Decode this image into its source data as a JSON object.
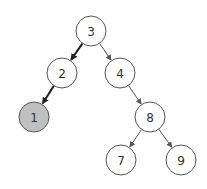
{
  "diagram": {
    "type": "binary-tree",
    "nodes": [
      {
        "id": "n3",
        "label": "3",
        "x": 91,
        "y": 31,
        "highlighted": false
      },
      {
        "id": "n2",
        "label": "2",
        "x": 62,
        "y": 73,
        "highlighted": false
      },
      {
        "id": "n4",
        "label": "4",
        "x": 120,
        "y": 73,
        "highlighted": false
      },
      {
        "id": "n1",
        "label": "1",
        "x": 34,
        "y": 117,
        "highlighted": true
      },
      {
        "id": "n8",
        "label": "8",
        "x": 150,
        "y": 117,
        "highlighted": false
      },
      {
        "id": "n7",
        "label": "7",
        "x": 121,
        "y": 160,
        "highlighted": false
      },
      {
        "id": "n9",
        "label": "9",
        "x": 181,
        "y": 160,
        "highlighted": false
      }
    ],
    "edges": [
      {
        "from": "n3",
        "to": "n2",
        "bold": true
      },
      {
        "from": "n3",
        "to": "n4",
        "bold": false
      },
      {
        "from": "n2",
        "to": "n1",
        "bold": true
      },
      {
        "from": "n4",
        "to": "n8",
        "bold": false
      },
      {
        "from": "n8",
        "to": "n7",
        "bold": false
      },
      {
        "from": "n8",
        "to": "n9",
        "bold": false
      }
    ],
    "colors": {
      "node_fill": "#ffffff",
      "node_stroke": "#555555",
      "highlight_fill": "#c0c0c0",
      "edge": "#555555",
      "edge_bold": "#222222"
    },
    "radius": 15
  }
}
